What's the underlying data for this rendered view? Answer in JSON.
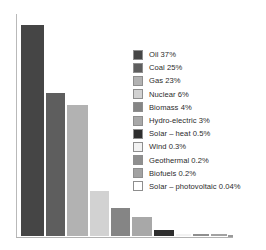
{
  "chart_data": {
    "type": "bar",
    "title": "",
    "subtitle": "",
    "xlabel": "",
    "ylabel": "",
    "grid": false,
    "legend_position": "right",
    "ylim": [
      0,
      40
    ],
    "categories": [
      "Oil",
      "Coal",
      "Gas",
      "Nuclear",
      "Biomass",
      "Hydro-electric",
      "Solar – heat",
      "Wind",
      "Geothermal",
      "Biofuels",
      "Solar – photovoltaic"
    ],
    "values": [
      37,
      25,
      23,
      6,
      4,
      3,
      0.5,
      0.3,
      0.2,
      0.2,
      0.04
    ],
    "value_labels": [
      "37%",
      "25%",
      "23%",
      "6%",
      "4%",
      "3%",
      "0.5%",
      "0.3%",
      "0.2%",
      "0.2%",
      "0.04%"
    ],
    "colors": [
      "#454545",
      "#5e5e5e",
      "#b2b2b2",
      "#d2d2d2",
      "#858585",
      "#a8a8a8",
      "#2e2e2e",
      "#f2f2f2",
      "#8f8f8f",
      "#a2a2a2",
      "#ffffff"
    ],
    "legend": [
      {
        "label": "Oil 37%",
        "color": "#454545"
      },
      {
        "label": "Coal 25%",
        "color": "#5e5e5e"
      },
      {
        "label": "Gas 23%",
        "color": "#b2b2b2"
      },
      {
        "label": "Nuclear 6%",
        "color": "#d2d2d2"
      },
      {
        "label": "Biomass 4%",
        "color": "#858585"
      },
      {
        "label": "Hydro-electric 3%",
        "color": "#a8a8a8"
      },
      {
        "label": "Solar – heat 0.5%",
        "color": "#2e2e2e"
      },
      {
        "label": "Wind 0.3%",
        "color": "#f2f2f2"
      },
      {
        "label": "Geothermal 0.2%",
        "color": "#8f8f8f"
      },
      {
        "label": "Biofuels 0.2%",
        "color": "#a2a2a2"
      },
      {
        "label": "Solar – photovoltaic 0.04%",
        "color": "#ffffff"
      }
    ],
    "axis_color": "#b1b1b1",
    "bar_geometry": [
      {
        "left": 4,
        "width": 25,
        "height": 213
      },
      {
        "left": 29,
        "width": 21,
        "height": 145
      },
      {
        "left": 50,
        "width": 23,
        "height": 133
      },
      {
        "left": 73,
        "width": 21,
        "height": 47
      },
      {
        "left": 94,
        "width": 21,
        "height": 30
      },
      {
        "left": 115,
        "width": 22,
        "height": 21
      },
      {
        "left": 137,
        "width": 22,
        "height": 8
      },
      {
        "left": 159,
        "width": 17,
        "height": 4
      },
      {
        "left": 176,
        "width": 18,
        "height": 4
      },
      {
        "left": 194,
        "width": 18,
        "height": 4
      },
      {
        "left": 212,
        "width": 5,
        "height": 2
      }
    ]
  }
}
